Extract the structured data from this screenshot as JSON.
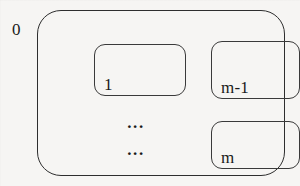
{
  "diagram": {
    "outer": {
      "label": "0",
      "label_name": "outer-region-label"
    },
    "boxes": [
      {
        "id": "box-one",
        "label": "1",
        "name": "inner-box-1"
      },
      {
        "id": "box-m-minus-1",
        "label": "m-1",
        "name": "inner-box-m-minus-1"
      },
      {
        "id": "box-m",
        "label": "m",
        "name": "inner-box-m"
      }
    ],
    "ellipses": [
      {
        "id": "ellipsis-row-1",
        "text": "..."
      },
      {
        "id": "ellipsis-row-2",
        "text": "..."
      }
    ],
    "colors": {
      "background": "#f6f5f3",
      "stroke_outer": "#2e2e2e",
      "stroke_inner": "#3a3a3a",
      "text": "#1a1a1a"
    }
  }
}
